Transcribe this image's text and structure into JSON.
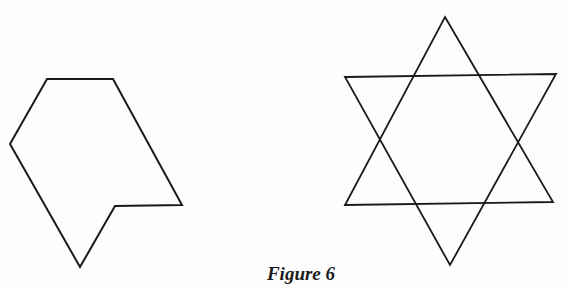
{
  "figure": {
    "caption": "Figure 6",
    "shapes": [
      {
        "name": "irregular-polygon",
        "points": "47,79 113,79 182,205 115,206 80,267 10,144"
      },
      {
        "name": "six-pointed-star-triangle-up",
        "points": "445,17 553,202 345,205"
      },
      {
        "name": "six-pointed-star-triangle-down",
        "points": "345,77 556,74 450,265"
      }
    ],
    "stroke_color": "#1a1a1a"
  }
}
